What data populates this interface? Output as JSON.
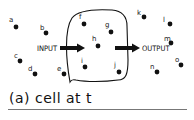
{
  "diagram": {
    "caption": "(a) cell at t",
    "input_label": "INPUT",
    "output_label": "OUTPUT",
    "colors": {
      "ink": "#111111",
      "background": "#ffffff",
      "rule": "#777777"
    },
    "nodes": [
      {
        "id": "a",
        "label": "a",
        "lx": 9,
        "ly": 22,
        "x": 16,
        "y": 27,
        "inside_cell": false
      },
      {
        "id": "b",
        "label": "b",
        "lx": 40,
        "ly": 30,
        "x": 46,
        "y": 33,
        "inside_cell": false
      },
      {
        "id": "c",
        "label": "c",
        "lx": 14,
        "ly": 58,
        "x": 20,
        "y": 61,
        "inside_cell": false
      },
      {
        "id": "d",
        "label": "d",
        "lx": 28,
        "ly": 71,
        "x": 35,
        "y": 74,
        "inside_cell": false
      },
      {
        "id": "e",
        "label": "e",
        "lx": 57,
        "ly": 71,
        "x": 64,
        "y": 74,
        "inside_cell": false
      },
      {
        "id": "f",
        "label": "f",
        "lx": 79,
        "ly": 19,
        "x": 84,
        "y": 24,
        "inside_cell": true
      },
      {
        "id": "g",
        "label": "g",
        "lx": 105,
        "ly": 27,
        "x": 111,
        "y": 32,
        "inside_cell": true
      },
      {
        "id": "h",
        "label": "h",
        "lx": 92,
        "ly": 41,
        "x": 98,
        "y": 46,
        "inside_cell": true
      },
      {
        "id": "i",
        "label": "i",
        "lx": 81,
        "ly": 63,
        "x": 85,
        "y": 67,
        "inside_cell": true
      },
      {
        "id": "j",
        "label": "j",
        "lx": 114,
        "ly": 67,
        "x": 119,
        "y": 72,
        "inside_cell": true
      },
      {
        "id": "k",
        "label": "k",
        "lx": 137,
        "ly": 15,
        "x": 144,
        "y": 17,
        "inside_cell": false
      },
      {
        "id": "l",
        "label": "l",
        "lx": 163,
        "ly": 22,
        "x": 170,
        "y": 24,
        "inside_cell": false
      },
      {
        "id": "m",
        "label": "m",
        "lx": 164,
        "ly": 41,
        "x": 171,
        "y": 43,
        "inside_cell": false
      },
      {
        "id": "n",
        "label": "n",
        "lx": 150,
        "ly": 69,
        "x": 157,
        "y": 72,
        "inside_cell": false
      },
      {
        "id": "o",
        "label": "o",
        "lx": 175,
        "ly": 62,
        "x": 181,
        "y": 65,
        "inside_cell": false
      }
    ]
  }
}
